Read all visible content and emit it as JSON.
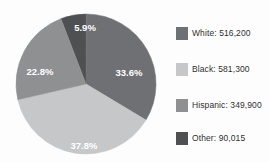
{
  "chart_data": {
    "type": "pie",
    "title": "",
    "subtitle": "",
    "xlabel": "",
    "ylabel": "",
    "grid": false,
    "legend_position": "right",
    "start_angle_deg": -21,
    "direction": "clockwise",
    "categories": [
      "Other",
      "White",
      "Black",
      "Hispanic"
    ],
    "values": [
      90015,
      516200,
      581300,
      349900
    ],
    "percent_labels": [
      "5.9%",
      "33.6%",
      "37.8%",
      "22.8%"
    ],
    "percents": [
      5.9,
      33.6,
      37.8,
      22.8
    ],
    "slice_colors": [
      "#4f5052",
      "#6f7073",
      "#c6c7c9",
      "#8e9092"
    ],
    "slices": [
      {
        "name": "Other",
        "label": "5.9%",
        "percent": 5.9,
        "value": 90015,
        "color": "#4f5052",
        "label_x": 77,
        "label_y": 22
      },
      {
        "name": "White",
        "label": "33.6%",
        "percent": 33.6,
        "value": 516200,
        "color": "#6f7073",
        "label_x": 121,
        "label_y": 67
      },
      {
        "name": "Black",
        "label": "37.8%",
        "percent": 37.8,
        "value": 581300,
        "color": "#c6c7c9",
        "label_x": 76,
        "label_y": 140
      },
      {
        "name": "Hispanic",
        "label": "22.8%",
        "percent": 22.8,
        "value": 349900,
        "color": "#8e9092",
        "label_x": 32,
        "label_y": 66
      }
    ],
    "legend": [
      {
        "label": "White: 516,200",
        "color": "#6f7073",
        "name": "White",
        "value": 516200
      },
      {
        "label": "Black: 581,300",
        "color": "#c6c7c9",
        "name": "Black",
        "value": 581300
      },
      {
        "label": "Hispanic: 349,900",
        "color": "#8e9092",
        "name": "Hispanic",
        "value": 349900
      },
      {
        "label": "Other: 90,015",
        "color": "#4f5052",
        "name": "Other",
        "value": 90015
      }
    ]
  }
}
